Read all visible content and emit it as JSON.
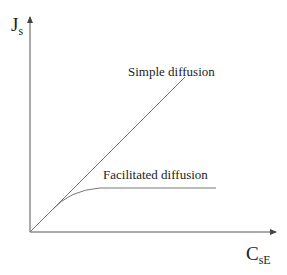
{
  "diagram": {
    "y_axis": {
      "symbol": "J",
      "subscript": "s"
    },
    "x_axis": {
      "symbol": "C",
      "subscript": "sE"
    },
    "curves": [
      {
        "name": "Simple diffusion",
        "shape": "linear"
      },
      {
        "name": "Facilitated diffusion",
        "shape": "saturating"
      }
    ],
    "colors": {
      "axis": "#555555",
      "curve": "#777777",
      "text": "#222222"
    }
  }
}
